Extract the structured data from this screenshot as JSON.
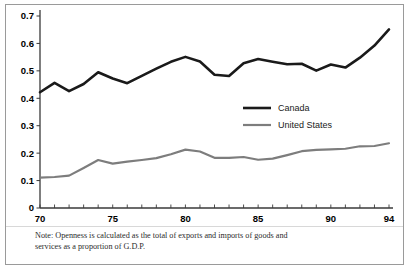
{
  "figure": {
    "note_line_1": "Note: Openness is calculated as the total of exports and imports of goods and",
    "note_line_2": "services as a proportion of G.D.P."
  },
  "colors": {
    "canada_line": "#1a1a1a",
    "us_line": "#7d7d7d",
    "axis": "#3a3a3a",
    "frame": "#9a9a9a",
    "background": "#ffffff"
  },
  "chart_data": {
    "type": "line",
    "title": "",
    "subtitle": "",
    "xlabel": "",
    "ylabel": "",
    "xlim": [
      70,
      94
    ],
    "ylim": [
      0,
      0.7
    ],
    "grid": false,
    "legend_position": "center-right",
    "x_tick_labels": [
      "70",
      "75",
      "80",
      "85",
      "90",
      "94"
    ],
    "x_tick_values": [
      70,
      75,
      80,
      85,
      90,
      94
    ],
    "x_minor_ticks": [
      70,
      71,
      72,
      73,
      74,
      75,
      76,
      77,
      78,
      79,
      80,
      81,
      82,
      83,
      84,
      85,
      86,
      87,
      88,
      89,
      90,
      91,
      92,
      93,
      94
    ],
    "y_tick_labels": [
      "0",
      "0.1",
      "0.2",
      "0.3",
      "0.4",
      "0.5",
      "0.6",
      "0.7"
    ],
    "y_tick_values": [
      0,
      0.1,
      0.2,
      0.3,
      0.4,
      0.5,
      0.6,
      0.7
    ],
    "x": [
      70,
      71,
      72,
      73,
      74,
      75,
      76,
      77,
      78,
      79,
      80,
      81,
      82,
      83,
      84,
      85,
      86,
      87,
      88,
      89,
      90,
      91,
      92,
      93,
      94
    ],
    "series": [
      {
        "name": "Canada",
        "color": "#1a1a1a",
        "values": [
          0.422,
          0.456,
          0.426,
          0.452,
          0.495,
          0.472,
          0.455,
          0.482,
          0.508,
          0.533,
          0.551,
          0.534,
          0.486,
          0.481,
          0.528,
          0.543,
          0.533,
          0.524,
          0.526,
          0.501,
          0.523,
          0.512,
          0.548,
          0.592,
          0.651
        ]
      },
      {
        "name": "United States",
        "color": "#7d7d7d",
        "values": [
          0.111,
          0.113,
          0.118,
          0.146,
          0.175,
          0.162,
          0.169,
          0.175,
          0.182,
          0.196,
          0.213,
          0.206,
          0.183,
          0.183,
          0.186,
          0.176,
          0.18,
          0.193,
          0.207,
          0.212,
          0.214,
          0.216,
          0.225,
          0.226,
          0.236
        ]
      }
    ]
  }
}
